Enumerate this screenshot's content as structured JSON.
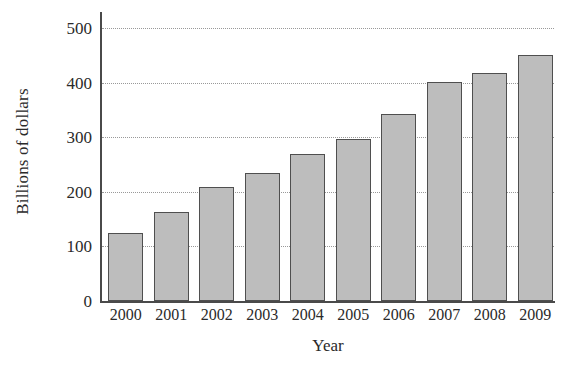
{
  "chart_data": {
    "type": "bar",
    "title": "",
    "xlabel": "Year",
    "ylabel": "Billions of dollars",
    "categories": [
      "2000",
      "2001",
      "2002",
      "2003",
      "2004",
      "2005",
      "2006",
      "2007",
      "2008",
      "2009"
    ],
    "values": [
      125,
      163,
      210,
      234,
      270,
      297,
      343,
      402,
      419,
      452
    ],
    "ylim": [
      0,
      530
    ],
    "yticks": [
      0,
      100,
      200,
      300,
      400,
      500
    ],
    "ytick_labels": [
      "0",
      "100",
      "200",
      "300",
      "400",
      "500"
    ],
    "grid": "horizontal-dotted",
    "legend": "none",
    "bar_fill_color": "#bdbdbd",
    "bar_edge_color": "#4f4f4f",
    "axis_color": "#4a4a4a",
    "grid_color": "#999999",
    "background_color": "#ffffff"
  }
}
